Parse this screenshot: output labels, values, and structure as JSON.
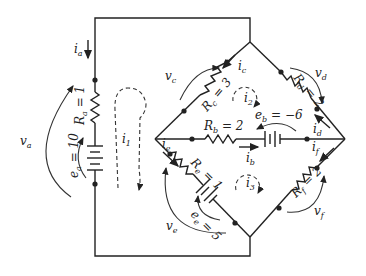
{
  "diagram": {
    "type": "electrical circuit",
    "branches": {
      "a": {
        "resistor_label": "R",
        "resistor_sub": "a",
        "resistor_value": "= 1",
        "source_label": "e",
        "source_sub": "a",
        "source_value": "= 10",
        "current": "i",
        "current_sub": "a",
        "voltage": "v",
        "voltage_sub": "a"
      },
      "b": {
        "resistor_label": "R",
        "resistor_sub": "b",
        "resistor_value": "= 2",
        "source_label": "e",
        "source_sub": "b",
        "source_value": "= −6",
        "current": "i",
        "current_sub": "b"
      },
      "c": {
        "resistor_label": "R",
        "resistor_sub": "c",
        "resistor_value": "= 3",
        "current": "i",
        "current_sub": "c",
        "voltage": "v",
        "voltage_sub": "c"
      },
      "d": {
        "resistor_label": "R",
        "resistor_sub": "d",
        "resistor_value": "= 2",
        "current": "i",
        "current_sub": "d",
        "voltage": "v",
        "voltage_sub": "d"
      },
      "e": {
        "resistor_label": "R",
        "resistor_sub": "e",
        "resistor_value": "= 1",
        "source_label": "e",
        "source_sub": "e",
        "source_value": "= 5",
        "current": "i",
        "current_sub": "e",
        "voltage": "v",
        "voltage_sub": "e"
      },
      "f": {
        "resistor_label": "R",
        "resistor_sub": "f",
        "resistor_value": "= 2",
        "current": "i",
        "current_sub": "f",
        "voltage": "v",
        "voltage_sub": "f"
      }
    },
    "loops": [
      {
        "label": "i",
        "sub": "1"
      },
      {
        "label": "i",
        "sub": "2"
      },
      {
        "label": "i",
        "sub": "3"
      }
    ]
  }
}
